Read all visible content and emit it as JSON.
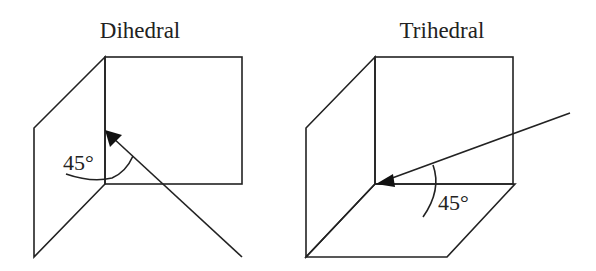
{
  "diagrams": [
    {
      "id": "dihedral",
      "title": "Dihedral",
      "angle_label": "45°"
    },
    {
      "id": "trihedral",
      "title": "Trihedral",
      "angle_label": "45°"
    }
  ],
  "colors": {
    "line": "#222222",
    "background": "#ffffff"
  }
}
